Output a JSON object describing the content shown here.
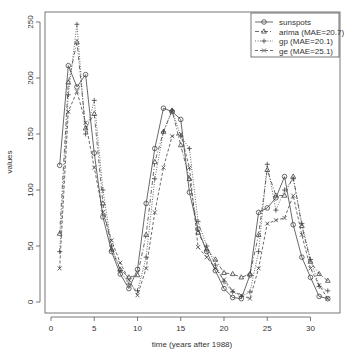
{
  "chart_data": {
    "type": "line",
    "title": "",
    "xlabel": "time (years after 1988)",
    "ylabel": "values",
    "xlim": [
      0,
      33
    ],
    "ylim": [
      0,
      255
    ],
    "xticks": [
      0,
      5,
      10,
      15,
      20,
      25,
      30
    ],
    "yticks": [
      0,
      50,
      100,
      150,
      200,
      250
    ],
    "grid": false,
    "legend_position": "top-right",
    "x": [
      1,
      2,
      3,
      4,
      5,
      6,
      7,
      8,
      9,
      10,
      11,
      12,
      13,
      14,
      15,
      16,
      17,
      18,
      19,
      20,
      21,
      22,
      23,
      24,
      25,
      26,
      27,
      28,
      29,
      30,
      31,
      32
    ],
    "series": [
      {
        "name": "sunspots",
        "marker": "circle",
        "line": "solid",
        "values": [
          122,
          211,
          192,
          203,
          133,
          76,
          45,
          25,
          12,
          29,
          88,
          137,
          173,
          170,
          163,
          98,
          65,
          45,
          28,
          12,
          4,
          3,
          24,
          80,
          84,
          93,
          112,
          69,
          40,
          22,
          5,
          3
        ]
      },
      {
        "name": "arima (MAE=20.7)",
        "marker": "triangle",
        "line": "dashdot",
        "values": [
          61,
          196,
          232,
          155,
          168,
          88,
          47,
          29,
          22,
          24,
          60,
          125,
          152,
          171,
          140,
          110,
          62,
          47,
          38,
          26,
          25,
          22,
          25,
          60,
          118,
          95,
          95,
          112,
          68,
          36,
          25,
          19
        ]
      },
      {
        "name": "gp (MAE=20.1)",
        "marker": "plus",
        "line": "dotted",
        "values": [
          45,
          185,
          248,
          150,
          180,
          100,
          50,
          28,
          16,
          10,
          40,
          110,
          152,
          171,
          148,
          137,
          72,
          50,
          33,
          18,
          9,
          5,
          9,
          45,
          123,
          82,
          100,
          110,
          70,
          38,
          14,
          10
        ]
      },
      {
        "name": "ge (MAE=25.1)",
        "marker": "x",
        "line": "dashed",
        "values": [
          30,
          170,
          188,
          160,
          120,
          80,
          55,
          35,
          20,
          6,
          30,
          80,
          120,
          148,
          150,
          120,
          49,
          40,
          30,
          20,
          10,
          6,
          3,
          30,
          70,
          73,
          75,
          95,
          60,
          30,
          15,
          3
        ]
      }
    ]
  },
  "legend": {
    "items": [
      "sunspots",
      "arima (MAE=20.7)",
      "gp (MAE=20.1)",
      "ge (MAE=25.1)"
    ]
  },
  "axes": {
    "xlabel": "time (years after 1988)",
    "ylabel": "values",
    "xticks": [
      "0",
      "5",
      "10",
      "15",
      "20",
      "25",
      "30"
    ],
    "yticks": [
      "0",
      "50",
      "100",
      "150",
      "200",
      "250"
    ]
  }
}
